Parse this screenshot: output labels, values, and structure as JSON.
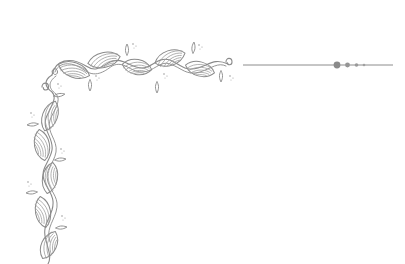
{
  "canvas": {
    "width": 405,
    "height": 264,
    "background": "#ffffff"
  },
  "ornament": {
    "style": "hand-drawn vine corner border with striped leaves",
    "stroke_color": "#8a8a8a",
    "hatch_color": "#9a9a9a",
    "divider": {
      "line_color": "#8c8c8c",
      "x1": 243,
      "x2": 393,
      "y": 65,
      "dots": [
        {
          "cx": 337,
          "r": 3.4,
          "color": "#8a8a8a"
        },
        {
          "cx": 347.5,
          "r": 2.4,
          "color": "#959595"
        },
        {
          "cx": 356.5,
          "r": 1.8,
          "color": "#9a9a9a"
        },
        {
          "cx": 364,
          "r": 1.3,
          "color": "#a0a0a0"
        }
      ]
    },
    "top_vine_leaves": 6,
    "left_vine_leaves": 6
  }
}
